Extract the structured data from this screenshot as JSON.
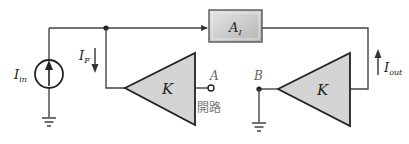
{
  "diagram": {
    "type": "current-feedback-circuit",
    "colors": {
      "wire": "#444444",
      "amplifier_fill": "#d4d4d4",
      "block_fill": "#c8c8c8",
      "label_gray": "#777777"
    },
    "labels": {
      "input_current": {
        "main": "I",
        "sub": "in"
      },
      "feedback_current": {
        "main": "I",
        "sub": "F"
      },
      "output_current": {
        "main": "I",
        "sub": "out"
      },
      "amplifier_block": {
        "main": "A",
        "sub": "I"
      },
      "left_feedback_gain": "K",
      "right_feedback_gain": "K",
      "node_a": "A",
      "node_b": "B",
      "open_circuit_note": "開路"
    }
  }
}
